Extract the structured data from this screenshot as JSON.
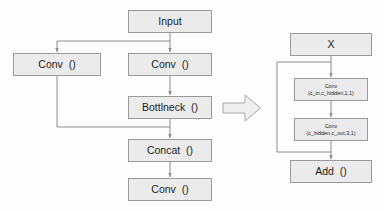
{
  "diagram": {
    "type": "flowchart",
    "background_color": "#fdfdfd",
    "node_fill_color": "#ebebeb",
    "node_border_color": "#9a9a9a",
    "edge_color": "#8c8c8c",
    "left_graph": {
      "name": "c3-module",
      "nodes": [
        {
          "id": "input",
          "label": "Input",
          "params": "",
          "x": 128,
          "y": 10,
          "w": 84,
          "h": 23
        },
        {
          "id": "conv_left",
          "label": "Conv",
          "params": "()",
          "x": 13,
          "y": 53,
          "w": 88,
          "h": 23
        },
        {
          "id": "conv_main",
          "label": "Conv",
          "params": "()",
          "x": 128,
          "y": 53,
          "w": 84,
          "h": 23
        },
        {
          "id": "bottlneck",
          "label": "Bottlneck",
          "params": "()",
          "x": 128,
          "y": 96,
          "w": 84,
          "h": 23
        },
        {
          "id": "concat",
          "label": "Concat",
          "params": "()",
          "x": 128,
          "y": 139,
          "w": 84,
          "h": 23
        },
        {
          "id": "conv_out",
          "label": "Conv",
          "params": "()",
          "x": 128,
          "y": 178,
          "w": 84,
          "h": 23
        }
      ],
      "edges": [
        {
          "from": "input",
          "to": "conv_main",
          "kind": "straight"
        },
        {
          "from": "input",
          "to": "conv_left",
          "kind": "branch-left"
        },
        {
          "from": "conv_main",
          "to": "bottlneck",
          "kind": "straight"
        },
        {
          "from": "bottlneck",
          "to": "concat",
          "kind": "straight"
        },
        {
          "from": "conv_left",
          "to": "concat",
          "kind": "skip-merge"
        },
        {
          "from": "concat",
          "to": "conv_out",
          "kind": "straight"
        }
      ]
    },
    "transition_arrow": {
      "name": "expands-to-arrow",
      "direction": "right",
      "x": 222,
      "y": 93,
      "w": 40,
      "h": 30
    },
    "right_graph": {
      "name": "bottleneck-block",
      "nodes": [
        {
          "id": "x",
          "label": "X",
          "params": "",
          "x": 290,
          "y": 33,
          "w": 82,
          "h": 23
        },
        {
          "id": "conv_1x1",
          "label": "Conv",
          "params": "(c_in,c_hidden,1,1)",
          "x": 294,
          "y": 78,
          "w": 74,
          "h": 23
        },
        {
          "id": "conv_3x3",
          "label": "Conv",
          "params": "(c_hidden,c_out,3,1)",
          "x": 294,
          "y": 118,
          "w": 74,
          "h": 23
        },
        {
          "id": "add",
          "label": "Add",
          "params": "()",
          "x": 290,
          "y": 160,
          "w": 82,
          "h": 23
        }
      ],
      "edges": [
        {
          "from": "x",
          "to": "conv_1x1",
          "kind": "straight"
        },
        {
          "from": "conv_1x1",
          "to": "conv_3x3",
          "kind": "straight"
        },
        {
          "from": "conv_3x3",
          "to": "add",
          "kind": "straight"
        },
        {
          "from": "x",
          "to": "add",
          "kind": "residual-skip"
        }
      ]
    }
  }
}
